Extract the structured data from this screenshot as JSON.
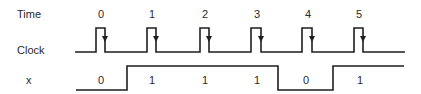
{
  "labels": {
    "time": "Time",
    "clock": "Clock",
    "x": "x"
  },
  "time_ticks": [
    "0",
    "1",
    "2",
    "3",
    "4",
    "5"
  ],
  "x_values": [
    "0",
    "1",
    "1",
    "1",
    "0",
    "1"
  ],
  "signals": {
    "clock": {
      "pulses": 6,
      "edge_marker": "falling-edge arrow"
    },
    "x": {
      "sequence": [
        0,
        1,
        1,
        1,
        0,
        1
      ]
    }
  }
}
